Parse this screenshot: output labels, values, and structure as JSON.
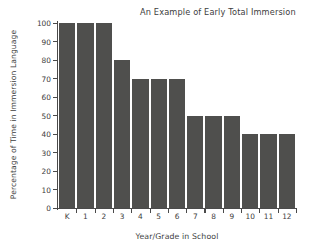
{
  "chart_data": {
    "type": "bar",
    "title": "An Example of Early Total Immersion",
    "xlabel": "Year/Grade in School",
    "ylabel": "Percentage of Time in Immersion Language",
    "categories": [
      "K",
      "1",
      "2",
      "3",
      "4",
      "5",
      "6",
      "7",
      "8",
      "9",
      "10",
      "11",
      "12"
    ],
    "values": [
      100,
      100,
      100,
      80,
      70,
      70,
      70,
      50,
      50,
      50,
      40,
      40,
      40
    ],
    "ylim": [
      0,
      100
    ],
    "yticks": [
      0,
      10,
      20,
      30,
      40,
      50,
      60,
      70,
      80,
      90,
      100
    ],
    "ytick_labels": [
      "0",
      "10",
      "20",
      "30",
      "40",
      "50",
      "60",
      "70",
      "80",
      "90",
      "100"
    ],
    "grid": false,
    "legend": false,
    "bar_color": "#4f4f4d",
    "axis_color": "#4a4a4a",
    "text_color": "#3d3d3d",
    "background": "#ffffff"
  }
}
